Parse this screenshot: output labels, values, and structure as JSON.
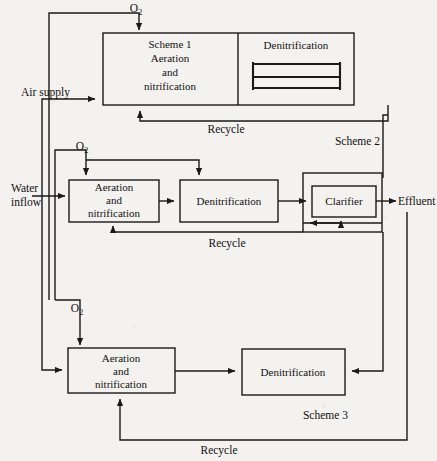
{
  "figure": {
    "type": "process-flow-diagram",
    "background_color": "#f4f2ef",
    "line_color": "#1a1a1a",
    "width": 437,
    "height": 461
  },
  "labels": {
    "o2_top": "O",
    "o2_mid": "O",
    "o2_bottom": "O",
    "o2_subscript": "2",
    "air_supply": "Air supply",
    "water_inflow_line1": "Water",
    "water_inflow_line2": "inflow",
    "effluent": "Effluent",
    "recycle_1": "Recycle",
    "recycle_2": "Recycle",
    "recycle_3": "Recycle",
    "scheme_2": "Scheme 2",
    "scheme_3": "Scheme 3"
  },
  "scheme1": {
    "title": "Scheme 1",
    "reactor_line1": "Aeration",
    "reactor_line2": "and",
    "reactor_line3": "nitrification",
    "denitrification": "Denitrification"
  },
  "scheme2": {
    "reactor_line1": "Aeration",
    "reactor_line2": "and",
    "reactor_line3": "nitrification",
    "denitrification": "Denitrification",
    "clarifier": "Clarifier"
  },
  "scheme3": {
    "reactor_line1": "Aeration",
    "reactor_line2": "and",
    "reactor_line3": "nitrification",
    "denitrification": "Denitrification"
  }
}
